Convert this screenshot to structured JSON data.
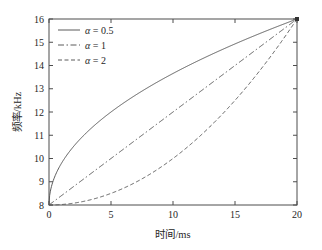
{
  "chart_data": {
    "type": "line",
    "title": "",
    "xlabel": "时间/ms",
    "ylabel": "频率/kHz",
    "xlim": [
      0,
      20
    ],
    "ylim": [
      8,
      16
    ],
    "xticks": [
      0,
      5,
      10,
      15,
      20
    ],
    "yticks": [
      8,
      9,
      10,
      11,
      12,
      13,
      14,
      15,
      16
    ],
    "grid": false,
    "legend_position": "upper-left",
    "x": [
      0,
      1,
      2,
      3,
      4,
      5,
      6,
      7,
      8,
      9,
      10,
      11,
      12,
      13,
      14,
      15,
      16,
      17,
      18,
      19,
      20
    ],
    "series": [
      {
        "name": "α = 0.5",
        "alpha": 0.5,
        "linestyle": "solid",
        "color": "#5a5a5a",
        "values": [
          8.0,
          9.79,
          10.53,
          11.1,
          11.58,
          12.0,
          12.38,
          12.73,
          13.06,
          13.37,
          13.66,
          13.94,
          14.2,
          14.45,
          14.7,
          14.93,
          15.16,
          15.38,
          15.59,
          15.8,
          16.0
        ]
      },
      {
        "name": "α = 1",
        "alpha": 1,
        "linestyle": "dashdot",
        "color": "#5a5a5a",
        "values": [
          8.0,
          8.4,
          8.8,
          9.2,
          9.6,
          10.0,
          10.4,
          10.8,
          11.2,
          11.6,
          12.0,
          12.4,
          12.8,
          13.2,
          13.6,
          14.0,
          14.4,
          14.8,
          15.2,
          15.6,
          16.0
        ]
      },
      {
        "name": "α = 2",
        "alpha": 2,
        "linestyle": "dashed",
        "color": "#5a5a5a",
        "values": [
          8.0,
          8.02,
          8.08,
          8.18,
          8.32,
          8.5,
          8.72,
          8.98,
          9.28,
          9.62,
          10.0,
          10.42,
          10.88,
          11.38,
          11.92,
          12.5,
          13.12,
          13.78,
          14.48,
          15.22,
          16.0
        ]
      }
    ],
    "legend": [
      {
        "label": "α = 0.5",
        "linestyle": "solid"
      },
      {
        "label": "α = 1",
        "linestyle": "dashdot"
      },
      {
        "label": "α = 2",
        "linestyle": "dashed"
      }
    ]
  },
  "axes": {
    "x_tick_labels": [
      "0",
      "5",
      "10",
      "15",
      "20"
    ],
    "y_tick_labels": [
      "8",
      "9",
      "10",
      "11",
      "12",
      "13",
      "14",
      "15",
      "16"
    ],
    "x_title": "时间/ms",
    "y_title": "频率/kHz"
  },
  "legend_items": [
    {
      "symbol": "α",
      "equals": "= 0.5",
      "full": "α = 0.5"
    },
    {
      "symbol": "α",
      "equals": "= 1",
      "full": "α = 1"
    },
    {
      "symbol": "α",
      "equals": "= 2",
      "full": "α = 2"
    }
  ]
}
